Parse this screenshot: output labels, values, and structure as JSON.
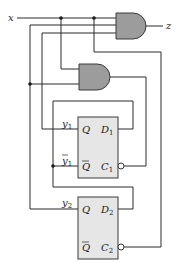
{
  "diagram": {
    "type": "sequential-logic-circuit",
    "input_label": "x",
    "output_label": "z",
    "gates": [
      {
        "id": "and1",
        "type": "AND",
        "inputs": [
          "x",
          "y2",
          "y1"
        ],
        "output": "z"
      },
      {
        "id": "and2",
        "type": "AND",
        "inputs": [
          "x",
          "y1_bar"
        ],
        "output": "clock"
      }
    ],
    "flip_flops": [
      {
        "id": "ff1",
        "q_label": "Q",
        "q_bar_label": "Q",
        "d_label": "D",
        "d_sub": "1",
        "c_label": "C",
        "c_sub": "1",
        "out_label": "y",
        "out_sub": "1",
        "out_bar_label": "y",
        "out_bar_sub": "1"
      },
      {
        "id": "ff2",
        "q_label": "Q",
        "q_bar_label": "Q",
        "d_label": "D",
        "d_sub": "2",
        "c_label": "C",
        "c_sub": "2",
        "out_label": "y",
        "out_sub": "2"
      }
    ],
    "colors": {
      "gate_fill": "#9c9c9c",
      "ff_fill": "#e6e6e6",
      "wire": "#2a2a2a"
    }
  }
}
